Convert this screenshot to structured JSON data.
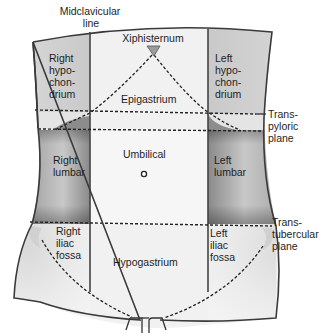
{
  "diagram": {
    "type": "anatomical-regions",
    "colors": {
      "background": "#ffffff",
      "outline": "#333333",
      "region_fill_light": "#eeeeee",
      "side_band_fill": "#cfcfcf",
      "side_band_dark": "#7d7d7d",
      "dashed_line": "#222222",
      "text": "#1e1e1e"
    },
    "reference_lines": {
      "midclavicular": {
        "lines": [
          "Midclavicular",
          "line"
        ]
      },
      "transpyloric": {
        "lines": [
          "Trans-",
          "pyloric",
          "plane"
        ]
      },
      "transtubercular": {
        "lines": [
          "Trans-",
          "tubercular",
          "plane"
        ]
      }
    },
    "landmarks": {
      "xiphisternum": "Xiphisternum"
    },
    "regions": {
      "right_hypochondrium": {
        "lines": [
          "Right",
          "hypo-",
          "chon-",
          "drium"
        ]
      },
      "epigastrium": {
        "lines": [
          "Epigastrium"
        ]
      },
      "left_hypochondrium": {
        "lines": [
          "Left",
          "hypo-",
          "chon-",
          "drium"
        ]
      },
      "right_lumbar": {
        "lines": [
          "Right",
          "lumbar"
        ]
      },
      "umbilical": {
        "lines": [
          "Umbilical"
        ]
      },
      "left_lumbar": {
        "lines": [
          "Left",
          "lumbar"
        ]
      },
      "right_iliac_fossa": {
        "lines": [
          "Right",
          "iliac",
          "fossa"
        ]
      },
      "hypogastrium": {
        "lines": [
          "Hypogastrium"
        ]
      },
      "left_iliac_fossa": {
        "lines": [
          "Left",
          "iliac",
          "fossa"
        ]
      }
    }
  }
}
